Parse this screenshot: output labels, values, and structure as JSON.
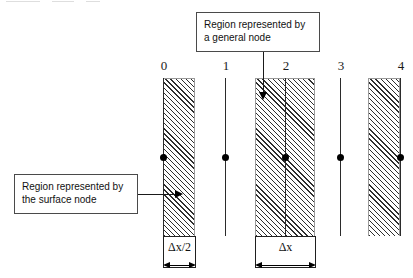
{
  "figure": {
    "type": "finite-difference-node-diagram",
    "node_labels": [
      "0",
      "1",
      "2",
      "3",
      "4"
    ],
    "nodes": [
      {
        "label": "0",
        "x": 163,
        "region": "half-right",
        "hatched": true
      },
      {
        "label": "1",
        "x": 225,
        "region": "none",
        "hatched": false
      },
      {
        "label": "2",
        "x": 285,
        "region": "centered",
        "hatched": true
      },
      {
        "label": "3",
        "x": 340,
        "region": "none",
        "hatched": false
      },
      {
        "label": "4",
        "x": 400,
        "region": "half-left",
        "hatched": true
      }
    ]
  },
  "callouts": {
    "general_node": {
      "text": "Region represented by\na general node",
      "points_to_node": "2"
    },
    "surface_node": {
      "text": "Region represented by\nthe surface node",
      "points_to_node": "0"
    }
  },
  "dimensions": {
    "half": {
      "label": "Δx/2",
      "applies_to_node": "0"
    },
    "full": {
      "label": "Δx",
      "applies_to_node": "2"
    }
  },
  "colors": {
    "line": "#2b2b2b",
    "hatch": "#2e2e2e",
    "node_dot": "#000000",
    "box_border": "#4a4a4a",
    "background": "#ffffff"
  }
}
